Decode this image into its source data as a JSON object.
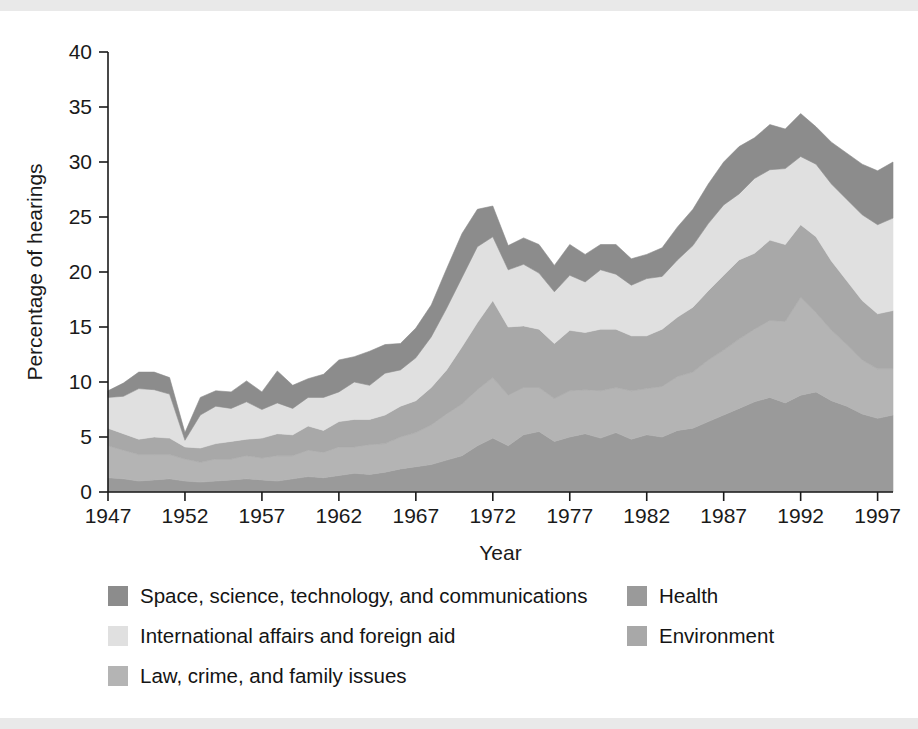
{
  "chart_data": {
    "type": "area",
    "stacked": true,
    "title": "",
    "xlabel": "Year",
    "ylabel": "Percentage of hearings",
    "xlim": [
      1947,
      1998
    ],
    "ylim": [
      0,
      40
    ],
    "yticks": [
      0,
      5,
      10,
      15,
      20,
      25,
      30,
      35,
      40
    ],
    "xticks": [
      1947,
      1952,
      1957,
      1962,
      1967,
      1972,
      1977,
      1982,
      1987,
      1992,
      1997
    ],
    "xtick_labels": [
      "1947",
      "1952",
      "1957",
      "1962",
      "1967",
      "1972",
      "1977",
      "1982",
      "1987",
      "1992",
      "1997"
    ],
    "ytick_labels": [
      "0",
      "5",
      "10",
      "15",
      "20",
      "25",
      "30",
      "35",
      "40"
    ],
    "grid": false,
    "legend_position": "below",
    "x": [
      1947,
      1948,
      1949,
      1950,
      1951,
      1952,
      1953,
      1954,
      1955,
      1956,
      1957,
      1958,
      1959,
      1960,
      1961,
      1962,
      1963,
      1964,
      1965,
      1966,
      1967,
      1968,
      1969,
      1970,
      1971,
      1972,
      1973,
      1974,
      1975,
      1976,
      1977,
      1978,
      1979,
      1980,
      1981,
      1982,
      1983,
      1984,
      1985,
      1986,
      1987,
      1988,
      1989,
      1990,
      1991,
      1992,
      1993,
      1994,
      1995,
      1996,
      1997,
      1998
    ],
    "series": [
      {
        "name": "Health",
        "color": "#9a9a9a",
        "values": [
          1.3,
          1.2,
          1.0,
          1.1,
          1.2,
          1.0,
          0.9,
          1.0,
          1.1,
          1.2,
          1.1,
          1.0,
          1.2,
          1.4,
          1.3,
          1.5,
          1.7,
          1.6,
          1.8,
          2.1,
          2.3,
          2.5,
          2.9,
          3.3,
          4.2,
          4.9,
          4.2,
          5.2,
          5.5,
          4.6,
          5.0,
          5.3,
          4.9,
          5.4,
          4.8,
          5.2,
          5.0,
          5.6,
          5.8,
          6.4,
          7.0,
          7.6,
          8.2,
          8.6,
          8.1,
          8.8,
          9.1,
          8.3,
          7.8,
          7.1,
          6.7,
          7.0
        ]
      },
      {
        "name": "Law, crime, and family issues",
        "color": "#b4b4b4",
        "values": [
          2.9,
          2.6,
          2.4,
          2.3,
          2.2,
          2.0,
          1.8,
          2.0,
          1.9,
          2.1,
          2.0,
          2.3,
          2.1,
          2.4,
          2.3,
          2.6,
          2.4,
          2.7,
          2.6,
          2.9,
          3.1,
          3.6,
          4.2,
          4.7,
          5.1,
          5.5,
          4.6,
          4.3,
          4.0,
          3.9,
          4.2,
          4.0,
          4.3,
          4.1,
          4.4,
          4.2,
          4.6,
          4.9,
          5.1,
          5.6,
          5.9,
          6.3,
          6.6,
          7.0,
          7.4,
          8.9,
          7.2,
          6.4,
          5.6,
          4.9,
          4.5,
          4.2
        ]
      },
      {
        "name": "Environment",
        "color": "#a8a8a8",
        "values": [
          1.6,
          1.5,
          1.4,
          1.6,
          1.5,
          1.1,
          1.3,
          1.4,
          1.6,
          1.5,
          1.8,
          2.0,
          1.9,
          2.2,
          2.0,
          2.3,
          2.5,
          2.3,
          2.6,
          2.8,
          2.9,
          3.4,
          4.0,
          5.2,
          6.1,
          7.0,
          6.2,
          5.6,
          5.3,
          5.0,
          5.5,
          5.2,
          5.6,
          5.3,
          5.0,
          4.8,
          5.2,
          5.4,
          5.9,
          6.3,
          6.8,
          7.2,
          6.9,
          7.3,
          7.0,
          6.6,
          6.9,
          6.3,
          5.8,
          5.4,
          5.0,
          5.3
        ]
      },
      {
        "name": "International affairs and foreign aid",
        "color": "#e0e0e0",
        "values": [
          2.8,
          3.4,
          4.6,
          4.3,
          4.0,
          0.6,
          3.0,
          3.4,
          3.0,
          3.4,
          2.6,
          2.8,
          2.4,
          2.6,
          3.0,
          2.7,
          3.4,
          3.1,
          3.8,
          3.3,
          3.9,
          4.6,
          5.6,
          6.3,
          6.9,
          5.8,
          5.2,
          5.6,
          5.1,
          4.7,
          5.0,
          4.6,
          5.4,
          5.0,
          4.6,
          5.2,
          4.8,
          5.2,
          5.6,
          6.1,
          6.4,
          6.0,
          6.8,
          6.4,
          6.9,
          6.2,
          6.6,
          7.0,
          7.4,
          7.8,
          8.1,
          8.4
        ]
      },
      {
        "name": "Space, science, technology, and communications",
        "color": "#8c8c8c",
        "values": [
          0.6,
          1.2,
          1.5,
          1.6,
          1.5,
          0.7,
          1.6,
          1.4,
          1.5,
          1.9,
          1.6,
          2.9,
          2.1,
          1.7,
          2.1,
          2.9,
          2.3,
          3.1,
          2.6,
          2.4,
          2.7,
          2.9,
          3.6,
          4.0,
          3.4,
          2.8,
          2.2,
          2.4,
          2.6,
          2.4,
          2.8,
          2.5,
          2.3,
          2.7,
          2.4,
          2.2,
          2.6,
          3.0,
          3.3,
          3.6,
          3.9,
          4.3,
          3.7,
          4.1,
          3.6,
          3.9,
          3.4,
          3.8,
          4.2,
          4.6,
          4.9,
          5.1
        ]
      }
    ]
  },
  "legend": {
    "columns": [
      {
        "items": [
          {
            "label": "Space, science, technology, and communications",
            "color": "#8c8c8c",
            "series": "Space, science, technology, and communications"
          },
          {
            "label": "International affairs and foreign aid",
            "color": "#e0e0e0",
            "series": "International affairs and foreign aid"
          },
          {
            "label": "Law, crime, and family issues",
            "color": "#b4b4b4",
            "series": "Law, crime, and family issues"
          }
        ]
      },
      {
        "items": [
          {
            "label": "Health",
            "color": "#9a9a9a",
            "series": "Health"
          },
          {
            "label": "Environment",
            "color": "#a8a8a8",
            "series": "Environment"
          }
        ]
      }
    ]
  }
}
